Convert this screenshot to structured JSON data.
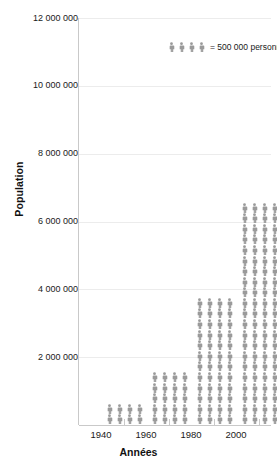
{
  "chart": {
    "type": "pictogram",
    "ylabel": "Population",
    "xlabel": "Années",
    "legend_text": "= 500 000 personnes",
    "legend_icon_count": 4,
    "figure_color": "#9a9a9a",
    "grid_color": "#ececec",
    "axis_color": "#c9c9c9",
    "icon_name": "person-icon",
    "unit_value": 125000,
    "icons_per_row": 4,
    "row_value": 500000
  },
  "chart_data": {
    "type": "bar",
    "title": "",
    "xlabel": "Années",
    "ylabel": "Population",
    "categories": [
      "1940",
      "1960",
      "1980",
      "2000"
    ],
    "values": [
      1000000,
      2500000,
      6000000,
      10500000
    ],
    "rows": [
      2,
      5,
      12,
      21
    ],
    "icons": [
      8,
      20,
      48,
      84
    ],
    "ylim": [
      0,
      12000000
    ],
    "ytick_labels": [
      "12 000 000",
      "10 000 000",
      "8 000 000",
      "6 000 000",
      "4 000 000",
      "2 000 000"
    ],
    "ytick_values": [
      12000000,
      10000000,
      8000000,
      6000000,
      4000000,
      2000000
    ],
    "xtick_labels": [
      "1940",
      "1960",
      "1980",
      "2000"
    ],
    "grid": true,
    "legend": "= 500 000 personnes",
    "legend_position": "inside-top-left"
  },
  "yticks": [
    {
      "label": "12 000 000",
      "top": 18
    },
    {
      "label": "10 000 000",
      "top": 85.8
    },
    {
      "label": "8 000 000",
      "top": 153.7
    },
    {
      "label": "6 000 000",
      "top": 221.5
    },
    {
      "label": "4 000 000",
      "top": 289.3
    },
    {
      "label": "2 000 000",
      "top": 357.2
    }
  ],
  "xticks": [
    {
      "label": "1940",
      "left": 23
    },
    {
      "label": "1960",
      "left": 68
    },
    {
      "label": "1980",
      "left": 113
    },
    {
      "label": "2000",
      "left": 158
    }
  ]
}
